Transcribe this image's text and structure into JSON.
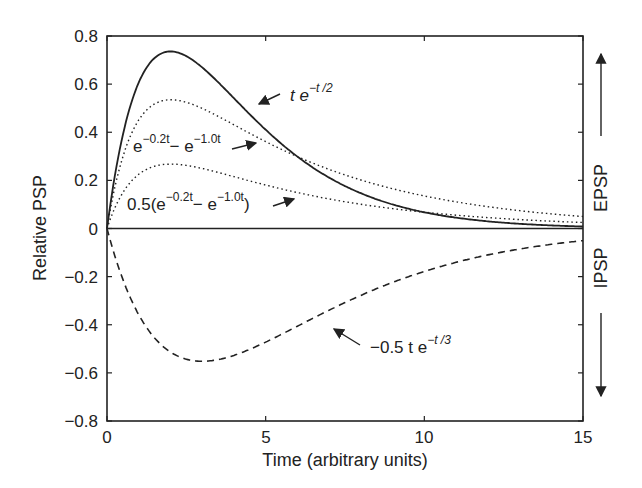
{
  "chart_data": {
    "type": "line",
    "title": "",
    "xlabel": "Time (arbitrary units)",
    "ylabel": "Relative PSP",
    "xlim": [
      0,
      15
    ],
    "ylim": [
      -0.8,
      0.8
    ],
    "x_ticks": [
      "0",
      "5",
      "10",
      "15"
    ],
    "y_ticks": [
      "0.8",
      "0.6",
      "0.4",
      "0.2",
      "0",
      "−0.2",
      "−0.4",
      "−0.6",
      "−0.8"
    ],
    "grid": false,
    "legend": "none (inline annotations with arrows)",
    "series": [
      {
        "name": "t e^{-t/2}",
        "style": "solid",
        "formula": "t*exp(-t/2)",
        "x": [
          0,
          1,
          2,
          3,
          4,
          5,
          6,
          7,
          8,
          9,
          10,
          11,
          12,
          13,
          14,
          15
        ],
        "values": [
          0,
          0.607,
          0.736,
          0.669,
          0.541,
          0.41,
          0.299,
          0.211,
          0.147,
          0.1,
          0.067,
          0.045,
          0.03,
          0.02,
          0.013,
          0.008
        ]
      },
      {
        "name": "e^{-0.2t} - e^{-1.0t}",
        "style": "dotted",
        "formula": "exp(-0.2t)-exp(-t)",
        "x": [
          0,
          1,
          2,
          3,
          4,
          5,
          6,
          7,
          8,
          9,
          10,
          11,
          12,
          13,
          14,
          15
        ],
        "values": [
          0,
          0.451,
          0.535,
          0.499,
          0.431,
          0.361,
          0.299,
          0.246,
          0.202,
          0.165,
          0.135,
          0.111,
          0.091,
          0.074,
          0.061,
          0.05
        ]
      },
      {
        "name": "0.5(e^{-0.2t} - e^{-1.0t})",
        "style": "dotted",
        "formula": "0.5*(exp(-0.2t)-exp(-t))",
        "x": [
          0,
          1,
          2,
          3,
          4,
          5,
          6,
          7,
          8,
          9,
          10,
          11,
          12,
          13,
          14,
          15
        ],
        "values": [
          0,
          0.225,
          0.268,
          0.25,
          0.215,
          0.181,
          0.149,
          0.123,
          0.101,
          0.083,
          0.068,
          0.055,
          0.045,
          0.037,
          0.03,
          0.025
        ]
      },
      {
        "name": "-0.5 t e^{-t/3}",
        "style": "dashed",
        "formula": "-0.5*t*exp(-t/3)",
        "x": [
          0,
          1,
          2,
          3,
          4,
          5,
          6,
          7,
          8,
          9,
          10,
          11,
          12,
          13,
          14,
          15
        ],
        "values": [
          0,
          -0.358,
          -0.513,
          -0.552,
          -0.527,
          -0.472,
          -0.406,
          -0.34,
          -0.278,
          -0.224,
          -0.178,
          -0.141,
          -0.11,
          -0.085,
          -0.066,
          -0.051
        ]
      }
    ],
    "annotations": [
      {
        "text": "t e",
        "sup": "−t /2",
        "target": "t e^{-t/2}"
      },
      {
        "text": "e",
        "sup": "−0.2t",
        "text2": "− e",
        "sup2": "−1.0t",
        "target": "e^{-0.2t} - e^{-1.0t}"
      },
      {
        "text": "0.5(e",
        "sup": "−0.2t",
        "text2": "− e",
        "sup2": "−1.0t",
        "text3": ")",
        "target": "0.5(e^{-0.2t} - e^{-1.0t})"
      },
      {
        "text": "−0.5 t e",
        "sup": "−t /3",
        "target": "-0.5 t e^{-t/3}"
      }
    ],
    "side_labels": [
      {
        "text": "EPSP",
        "direction": "up"
      },
      {
        "text": "IPSP",
        "direction": "down"
      }
    ]
  }
}
